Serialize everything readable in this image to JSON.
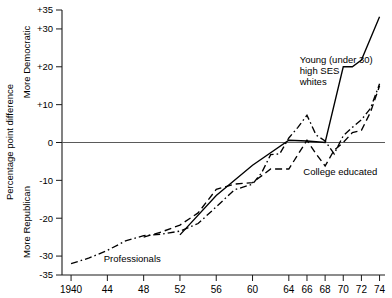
{
  "chart_data": {
    "type": "line",
    "title": "",
    "xlabel": "",
    "ylabel": "Percentage point difference",
    "ylabel_upper": "More Democratic",
    "ylabel_lower": "More Republican",
    "xlim": [
      1939,
      1974.6
    ],
    "ylim": [
      -35,
      35
    ],
    "grid": false,
    "legend_position": "inline-annotations",
    "y_ticks": [
      35,
      30,
      20,
      10,
      0,
      -10,
      -20,
      -30,
      -35
    ],
    "y_tick_labels": [
      "+35",
      "+30",
      "+20",
      "+10",
      "0",
      "-10",
      "-20",
      "-30",
      "-35"
    ],
    "x_ticks": [
      1940,
      1944,
      1948,
      1952,
      1956,
      1960,
      1964,
      1966,
      1968,
      1970,
      1972,
      1974
    ],
    "x_tick_labels": [
      "1940",
      "44",
      "48",
      "52",
      "56",
      "60",
      "64",
      "66",
      "68",
      "70",
      "72",
      "74"
    ],
    "zero_line": 0,
    "series": [
      {
        "name": "Professionals",
        "style": "dash-dot",
        "label": "Professionals",
        "label_x": 1943.6,
        "label_y": -31.5,
        "points": [
          [
            1940,
            -32.0
          ],
          [
            1942,
            -30.5
          ],
          [
            1944,
            -28.5
          ],
          [
            1946,
            -26.0
          ],
          [
            1948,
            -24.6
          ],
          [
            1950,
            -24.2
          ],
          [
            1952,
            -23.4
          ],
          [
            1954,
            -21.4
          ],
          [
            1956,
            -17.0
          ],
          [
            1958,
            -12.5
          ],
          [
            1960,
            -11.0
          ],
          [
            1961,
            -8.0
          ],
          [
            1962,
            -3.2
          ],
          [
            1963,
            -3.0
          ],
          [
            1964,
            1.2
          ],
          [
            1965,
            4.0
          ],
          [
            1966,
            7.2
          ],
          [
            1967,
            2.0
          ],
          [
            1968,
            0.4
          ],
          [
            1969,
            -3.0
          ],
          [
            1970,
            1.8
          ],
          [
            1971,
            4.0
          ],
          [
            1972,
            6.0
          ],
          [
            1973,
            9.0
          ],
          [
            1974,
            15.5
          ]
        ]
      },
      {
        "name": "College educated",
        "style": "dashed",
        "label": "College educated",
        "label_x": 1965.6,
        "label_y": -8.6,
        "points": [
          [
            1948,
            -25.0
          ],
          [
            1950,
            -23.6
          ],
          [
            1952,
            -21.8
          ],
          [
            1954,
            -18.6
          ],
          [
            1956,
            -12.4
          ],
          [
            1958,
            -11.0
          ],
          [
            1960,
            -10.6
          ],
          [
            1962,
            -7.0
          ],
          [
            1964,
            -7.0
          ],
          [
            1965,
            -3.2
          ],
          [
            1966,
            0.6
          ],
          [
            1967,
            -3.0
          ],
          [
            1968,
            -6.2
          ],
          [
            1969,
            -2.0
          ],
          [
            1970,
            0.0
          ],
          [
            1971,
            2.6
          ],
          [
            1972,
            3.2
          ],
          [
            1973,
            8.0
          ],
          [
            1974,
            15.0
          ]
        ]
      },
      {
        "name": "Young (under 30) high SES whites",
        "style": "solid",
        "label": "Young (under 30)\nhigh SES\nwhites",
        "label_lines": [
          "Young (under 30)",
          "high SES",
          "whites"
        ],
        "label_x": 1965.2,
        "label_y": 21.0,
        "points": [
          [
            1952,
            -24.4
          ],
          [
            1956,
            -14.0
          ],
          [
            1960,
            -6.0
          ],
          [
            1964,
            0.6
          ],
          [
            1966,
            0.4
          ],
          [
            1968,
            0.0
          ],
          [
            1970,
            20.0
          ],
          [
            1971,
            20.0
          ],
          [
            1972,
            21.8
          ],
          [
            1974,
            33.2
          ]
        ]
      }
    ]
  }
}
